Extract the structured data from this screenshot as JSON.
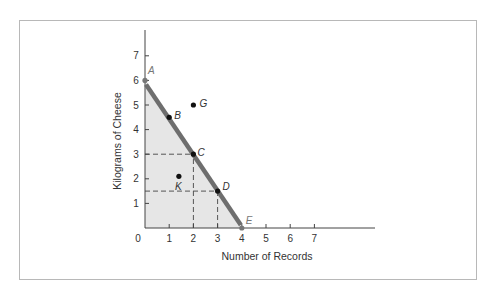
{
  "chart_data": {
    "type": "line",
    "title": "",
    "xlabel": "Number of Records",
    "ylabel": "Kilograms of Cheese",
    "xlim": [
      0,
      7
    ],
    "ylim": [
      0,
      7
    ],
    "x_ticks": [
      "0",
      "1",
      "2",
      "3",
      "4",
      "5",
      "6",
      "7"
    ],
    "y_ticks": [
      "1",
      "2",
      "3",
      "4",
      "5",
      "6",
      "7"
    ],
    "grid": false,
    "legend": null,
    "series": [
      {
        "name": "Production possibilities frontier",
        "x": [
          0,
          4
        ],
        "y": [
          6,
          0
        ],
        "shaded_below": true
      }
    ],
    "points": [
      {
        "label": "A",
        "x": 0,
        "y": 6,
        "on_frontier": true
      },
      {
        "label": "B",
        "x": 1,
        "y": 4.5,
        "on_frontier": true
      },
      {
        "label": "C",
        "x": 2,
        "y": 3,
        "on_frontier": true
      },
      {
        "label": "D",
        "x": 3,
        "y": 1.5,
        "on_frontier": true
      },
      {
        "label": "E",
        "x": 4,
        "y": 0,
        "on_frontier": true
      },
      {
        "label": "G",
        "x": 2,
        "y": 5,
        "on_frontier": false
      },
      {
        "label": "K",
        "x": 1.4,
        "y": 2.1,
        "on_frontier": false
      }
    ],
    "guides": [
      {
        "from": [
          0,
          3
        ],
        "to": [
          2,
          3
        ],
        "style": "dashed"
      },
      {
        "from": [
          2,
          0
        ],
        "to": [
          2,
          3
        ],
        "style": "dashed"
      },
      {
        "from": [
          0,
          1.5
        ],
        "to": [
          3,
          1.5
        ],
        "style": "dashed"
      },
      {
        "from": [
          3,
          0
        ],
        "to": [
          3,
          1.5
        ],
        "style": "dashed"
      }
    ],
    "colors": {
      "frontier": "#6e6e6e",
      "shade": "#e6e6e6",
      "axis": "#444444",
      "point": "#111111",
      "endpoint": "#777777"
    }
  }
}
